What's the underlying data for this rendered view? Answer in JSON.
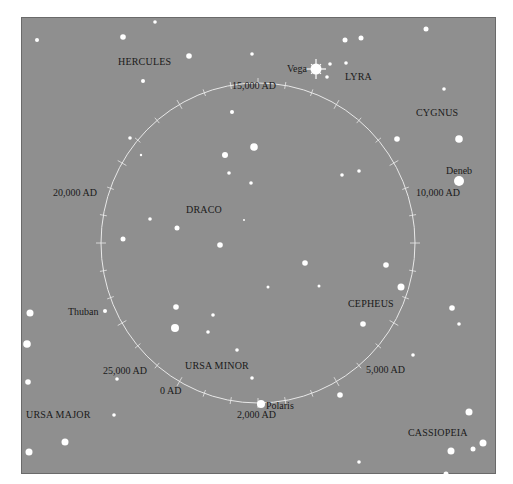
{
  "chart_data": {
    "type": "diagram",
    "circle": {
      "cx": 258,
      "cy": 243,
      "rx": 157,
      "ry": 160,
      "color": "#e8e8e8"
    },
    "background_color": "#8f8f8f",
    "constellations": [
      {
        "name": "HERCULES",
        "x": 118,
        "y": 65
      },
      {
        "name": "LYRA",
        "x": 345,
        "y": 80
      },
      {
        "name": "CYGNUS",
        "x": 416,
        "y": 116
      },
      {
        "name": "DRACO",
        "x": 186,
        "y": 213
      },
      {
        "name": "CEPHEUS",
        "x": 348,
        "y": 307
      },
      {
        "name": "URSA MINOR",
        "x": 185,
        "y": 369
      },
      {
        "name": "URSA MAJOR",
        "x": 26,
        "y": 418
      },
      {
        "name": "CASSIOPEIA",
        "x": 408,
        "y": 436
      }
    ],
    "named_stars": [
      {
        "name": "Vega",
        "x": 316,
        "y": 69,
        "label_x": 287,
        "label_y": 72,
        "r": 5.5,
        "sparkle": true
      },
      {
        "name": "Deneb",
        "x": 459,
        "y": 181,
        "label_x": 446,
        "label_y": 174,
        "r": 5
      },
      {
        "name": "Thuban",
        "x": 105,
        "y": 311,
        "label_x": 68,
        "label_y": 315,
        "r": 2
      },
      {
        "name": "Polaris",
        "x": 261,
        "y": 404,
        "label_x": 266,
        "label_y": 409,
        "r": 4
      }
    ],
    "date_markers": [
      {
        "label": "15,000 AD",
        "x": 232,
        "y": 89
      },
      {
        "label": "10,000 AD",
        "x": 416,
        "y": 196
      },
      {
        "label": "20,000 AD",
        "x": 53,
        "y": 196
      },
      {
        "label": "25,000 AD",
        "x": 103,
        "y": 374
      },
      {
        "label": "0 AD",
        "x": 160,
        "y": 394
      },
      {
        "label": "2,000 AD",
        "x": 237,
        "y": 418
      },
      {
        "label": "5,000 AD",
        "x": 366,
        "y": 373
      }
    ],
    "stars": [
      {
        "x": 37,
        "y": 40,
        "r": 2
      },
      {
        "x": 123,
        "y": 37,
        "r": 2.8
      },
      {
        "x": 155,
        "y": 22,
        "r": 1.8
      },
      {
        "x": 189,
        "y": 56,
        "r": 2.8
      },
      {
        "x": 143,
        "y": 81,
        "r": 2
      },
      {
        "x": 252,
        "y": 54,
        "r": 1.8
      },
      {
        "x": 345,
        "y": 40,
        "r": 2.5
      },
      {
        "x": 361,
        "y": 38,
        "r": 2.5
      },
      {
        "x": 426,
        "y": 29,
        "r": 2.5
      },
      {
        "x": 330,
        "y": 64,
        "r": 1.8
      },
      {
        "x": 346,
        "y": 63,
        "r": 1.8
      },
      {
        "x": 327,
        "y": 77,
        "r": 1.8
      },
      {
        "x": 444,
        "y": 89,
        "r": 1.8
      },
      {
        "x": 397,
        "y": 139,
        "r": 2.8
      },
      {
        "x": 459,
        "y": 139,
        "r": 3.8
      },
      {
        "x": 130,
        "y": 138,
        "r": 1.8
      },
      {
        "x": 141,
        "y": 155,
        "r": 1.2
      },
      {
        "x": 232,
        "y": 112,
        "r": 2
      },
      {
        "x": 225,
        "y": 155,
        "r": 3
      },
      {
        "x": 254,
        "y": 147,
        "r": 3.8
      },
      {
        "x": 229,
        "y": 173,
        "r": 1.8
      },
      {
        "x": 251,
        "y": 183,
        "r": 1.8
      },
      {
        "x": 342,
        "y": 175,
        "r": 1.8
      },
      {
        "x": 359,
        "y": 171,
        "r": 1.8
      },
      {
        "x": 150,
        "y": 219,
        "r": 1.8
      },
      {
        "x": 177,
        "y": 228,
        "r": 2.5
      },
      {
        "x": 123,
        "y": 239,
        "r": 2.5
      },
      {
        "x": 220,
        "y": 245,
        "r": 2.8
      },
      {
        "x": 244,
        "y": 220,
        "r": 1
      },
      {
        "x": 305,
        "y": 263,
        "r": 2.8
      },
      {
        "x": 386,
        "y": 265,
        "r": 2.8
      },
      {
        "x": 401,
        "y": 287,
        "r": 3.5
      },
      {
        "x": 268,
        "y": 287,
        "r": 1.5
      },
      {
        "x": 319,
        "y": 286,
        "r": 1.5
      },
      {
        "x": 363,
        "y": 324,
        "r": 2.8
      },
      {
        "x": 452,
        "y": 308,
        "r": 2.8
      },
      {
        "x": 459,
        "y": 324,
        "r": 1.8
      },
      {
        "x": 413,
        "y": 355,
        "r": 1.8
      },
      {
        "x": 176,
        "y": 307,
        "r": 2.8
      },
      {
        "x": 175,
        "y": 328,
        "r": 4
      },
      {
        "x": 213,
        "y": 315,
        "r": 1.8
      },
      {
        "x": 208,
        "y": 332,
        "r": 1.8
      },
      {
        "x": 237,
        "y": 350,
        "r": 1.8
      },
      {
        "x": 252,
        "y": 378,
        "r": 1.8
      },
      {
        "x": 340,
        "y": 395,
        "r": 2.8
      },
      {
        "x": 30,
        "y": 313,
        "r": 3.5
      },
      {
        "x": 27,
        "y": 344,
        "r": 3.8
      },
      {
        "x": 28,
        "y": 382,
        "r": 2.8
      },
      {
        "x": 117,
        "y": 379,
        "r": 1.8
      },
      {
        "x": 114,
        "y": 415,
        "r": 1.8
      },
      {
        "x": 65,
        "y": 442,
        "r": 3.5
      },
      {
        "x": 29,
        "y": 452,
        "r": 3.5
      },
      {
        "x": 469,
        "y": 412,
        "r": 3.5
      },
      {
        "x": 451,
        "y": 451,
        "r": 3.5
      },
      {
        "x": 473,
        "y": 449,
        "r": 2.5
      },
      {
        "x": 483,
        "y": 443,
        "r": 3.5
      },
      {
        "x": 359,
        "y": 462,
        "r": 1.8
      },
      {
        "x": 446,
        "y": 474,
        "r": 2.5
      }
    ]
  }
}
